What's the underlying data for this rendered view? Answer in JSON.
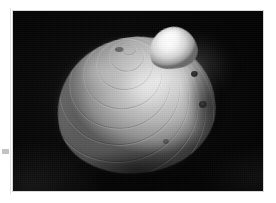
{
  "page": {
    "background_color": "#ffffff",
    "width": 276,
    "height": 203,
    "margin_mark_name": "margin-speck"
  },
  "photo": {
    "name": "bivalve-shell-photograph",
    "background_color": "#050505",
    "frame": {
      "left": 13,
      "top": 11,
      "width": 250,
      "height": 180
    },
    "subject": "clam shell",
    "orientation": "umbo uppermost, valve exterior facing viewer",
    "color_mode": "grayscale",
    "alt_text": "Grayscale photograph of a bivalve clam shell on a black background",
    "features": {
      "umbo_label": "umbo",
      "body_label": "valve body",
      "growth_rings_label": "concentric growth rings",
      "highlight_label": "specular highlight",
      "blemishes_label": "dark borings",
      "halo_label": "light halo"
    },
    "tones": {
      "shell_highlight": "#ffffff",
      "shell_light": "#e6e6e6",
      "shell_mid": "#b4b4b4",
      "shell_shadow": "#5a5a5a",
      "field_black": "#050505",
      "halo_gray": "#8c8c8c"
    },
    "ring_count": 11
  }
}
